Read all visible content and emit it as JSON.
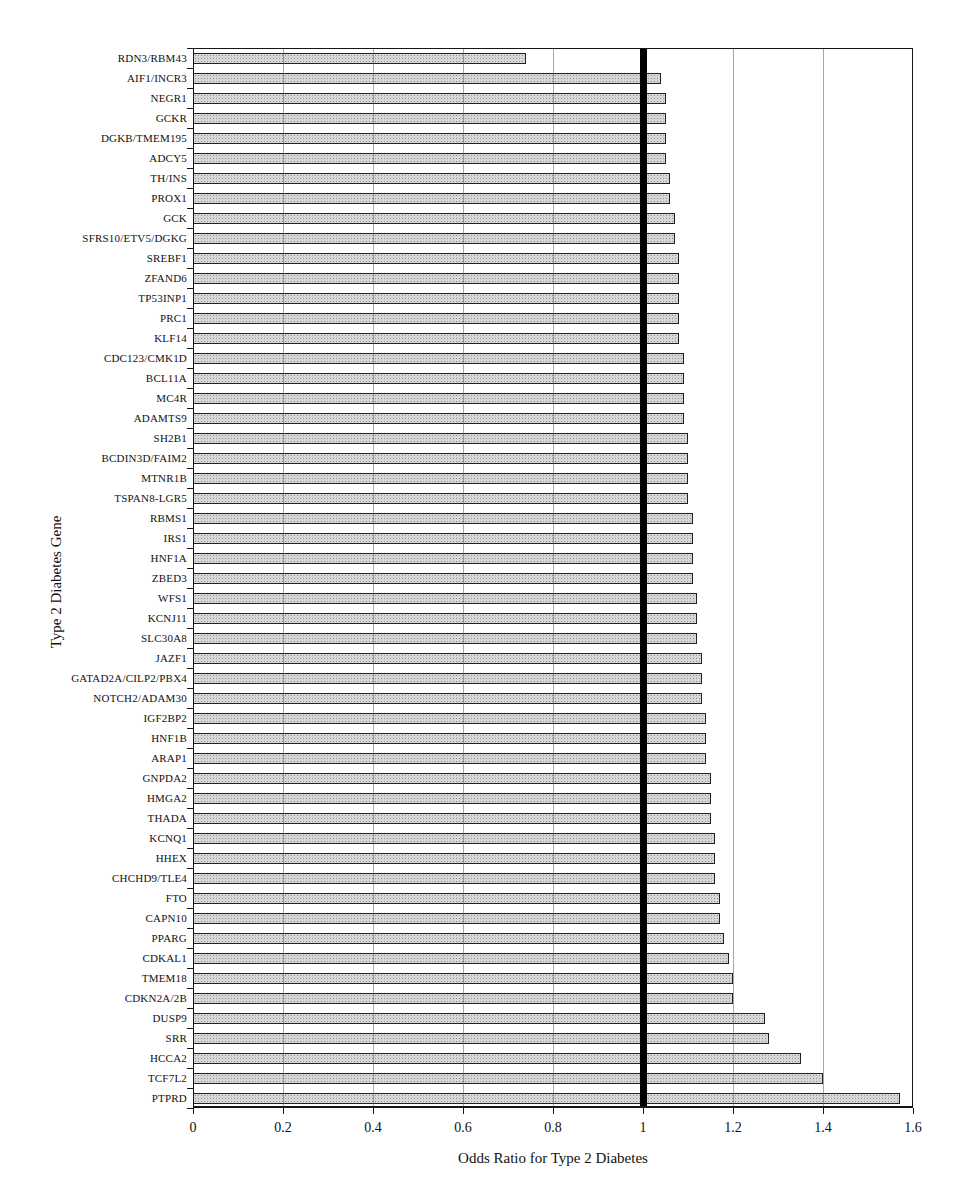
{
  "figure": {
    "background": "#ffffff",
    "frame_color": "#161616",
    "gridline_color": "#5f5f5f"
  },
  "chart_data": {
    "type": "bar",
    "orientation": "horizontal",
    "title": "",
    "xlabel": "Odds Ratio for Type 2 Diabetes",
    "ylabel": "Type 2 Diabetes Gene",
    "xlim": [
      0,
      1.6
    ],
    "xticks": [
      0,
      0.2,
      0.4,
      0.6,
      0.8,
      1,
      1.2,
      1.4,
      1.6
    ],
    "xtick_labels": [
      "0",
      "0.2",
      "0.4",
      "0.6",
      "0.8",
      "1",
      "1.2",
      "1.4",
      "1.6"
    ],
    "grid": "vertical gridlines at every 0.2, full plot frame",
    "legend": "none",
    "reference_line": {
      "x": 1,
      "style": "thick solid black vertical line"
    },
    "bar_fill_color": "#d7d7d7",
    "bar_speckle_color": "#8e8e8e",
    "bar_border_color": "#1f1f1f",
    "sort_order": "ascending odds ratio, top to bottom",
    "categories": [
      "RDN3/RBM43",
      "AIF1/INCR3",
      "NEGR1",
      "GCKR",
      "DGKB/TMEM195",
      "ADCY5",
      "TH/INS",
      "PROX1",
      "GCK",
      "SFRS10/ETV5/DGKG",
      "SREBF1",
      "ZFAND6",
      "TP53INP1",
      "PRC1",
      "KLF14",
      "CDC123/CMK1D",
      "BCL11A",
      "MC4R",
      "ADAMTS9",
      "SH2B1",
      "BCDIN3D/FAIM2",
      "MTNR1B",
      "TSPAN8-LGR5",
      "RBMS1",
      "IRS1",
      "HNF1A",
      "ZBED3",
      "WFS1",
      "KCNJ11",
      "SLC30A8",
      "JAZF1",
      "GATAD2A/CILP2/PBX4",
      "NOTCH2/ADAM30",
      "IGF2BP2",
      "HNF1B",
      "ARAP1",
      "GNPDA2",
      "HMGA2",
      "THADA",
      "KCNQ1",
      "HHEX",
      "CHCHD9/TLE4",
      "FTO",
      "CAPN10",
      "PPARG",
      "CDKAL1",
      "TMEM18",
      "CDKN2A/2B",
      "DUSP9",
      "SRR",
      "HCCA2",
      "TCF7L2",
      "PTPRD"
    ],
    "values": [
      0.74,
      1.04,
      1.05,
      1.05,
      1.05,
      1.05,
      1.06,
      1.06,
      1.07,
      1.07,
      1.08,
      1.08,
      1.08,
      1.08,
      1.08,
      1.09,
      1.09,
      1.09,
      1.09,
      1.1,
      1.1,
      1.1,
      1.1,
      1.11,
      1.11,
      1.11,
      1.11,
      1.12,
      1.12,
      1.12,
      1.13,
      1.13,
      1.13,
      1.14,
      1.14,
      1.14,
      1.15,
      1.15,
      1.15,
      1.16,
      1.16,
      1.16,
      1.17,
      1.17,
      1.18,
      1.19,
      1.2,
      1.2,
      1.27,
      1.28,
      1.35,
      1.4,
      1.57
    ]
  }
}
